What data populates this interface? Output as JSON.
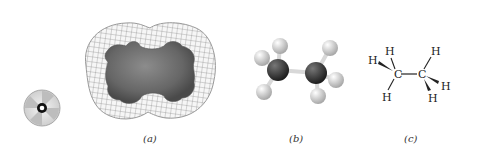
{
  "figure": {
    "panels": [
      {
        "id": "a",
        "caption": "(a)",
        "depicts": "electron density surface (mesh) around space-filling model"
      },
      {
        "id": "b",
        "caption": "(b)",
        "depicts": "ball-and-stick model"
      },
      {
        "id": "c",
        "caption": "(c)",
        "depicts": "wedge-dash structural formula"
      }
    ],
    "disc_icon": "cd-disc-icon",
    "structural_formula": {
      "carbons": [
        "C",
        "C"
      ],
      "hydrogens_left": [
        "H",
        "H",
        "H"
      ],
      "hydrogens_right": [
        "H",
        "H",
        "H"
      ]
    },
    "colors": {
      "mesh": "#8a8a8a",
      "surface": "#6e6e6e",
      "carbon": "#3a3a3a",
      "hydrogen": "#d8d8d8",
      "text": "#222222"
    }
  }
}
